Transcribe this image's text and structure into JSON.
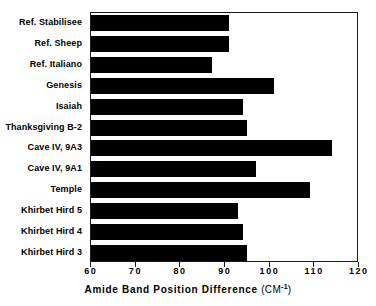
{
  "chart_data": {
    "type": "bar",
    "orientation": "horizontal",
    "title": "",
    "xlabel": "Amide Band Position Difference (CM-1)",
    "xlabel_text": "Amide Band Position Difference",
    "xlabel_unit": "(CM",
    "xlabel_unit_exp": "-1",
    "xlabel_unit_close": ")",
    "ylabel": "",
    "categories": [
      "Ref. Stabilisee",
      "Ref. Sheep",
      "Ref. Italiano",
      "Genesis",
      "Isaiah",
      "Thanksgiving B-2",
      "Cave IV, 9A3",
      "Cave IV, 9A1",
      "Temple",
      "Khirbet Hird 5",
      "Khirbet Hird 4",
      "Khirbet Hird 3"
    ],
    "values": [
      91,
      91,
      87,
      101,
      94,
      95,
      114,
      97,
      109,
      93,
      94,
      95
    ],
    "xlim": [
      60,
      120
    ],
    "xticks": [
      60,
      70,
      80,
      90,
      100,
      110,
      120
    ],
    "xtick_labels": [
      "60",
      "70",
      "80",
      "90",
      "100",
      "110",
      "120"
    ],
    "grid": false,
    "legend": false,
    "bar_color": "#000000",
    "frame_color": "#1a1a1a",
    "background_color": "#ffffff"
  }
}
